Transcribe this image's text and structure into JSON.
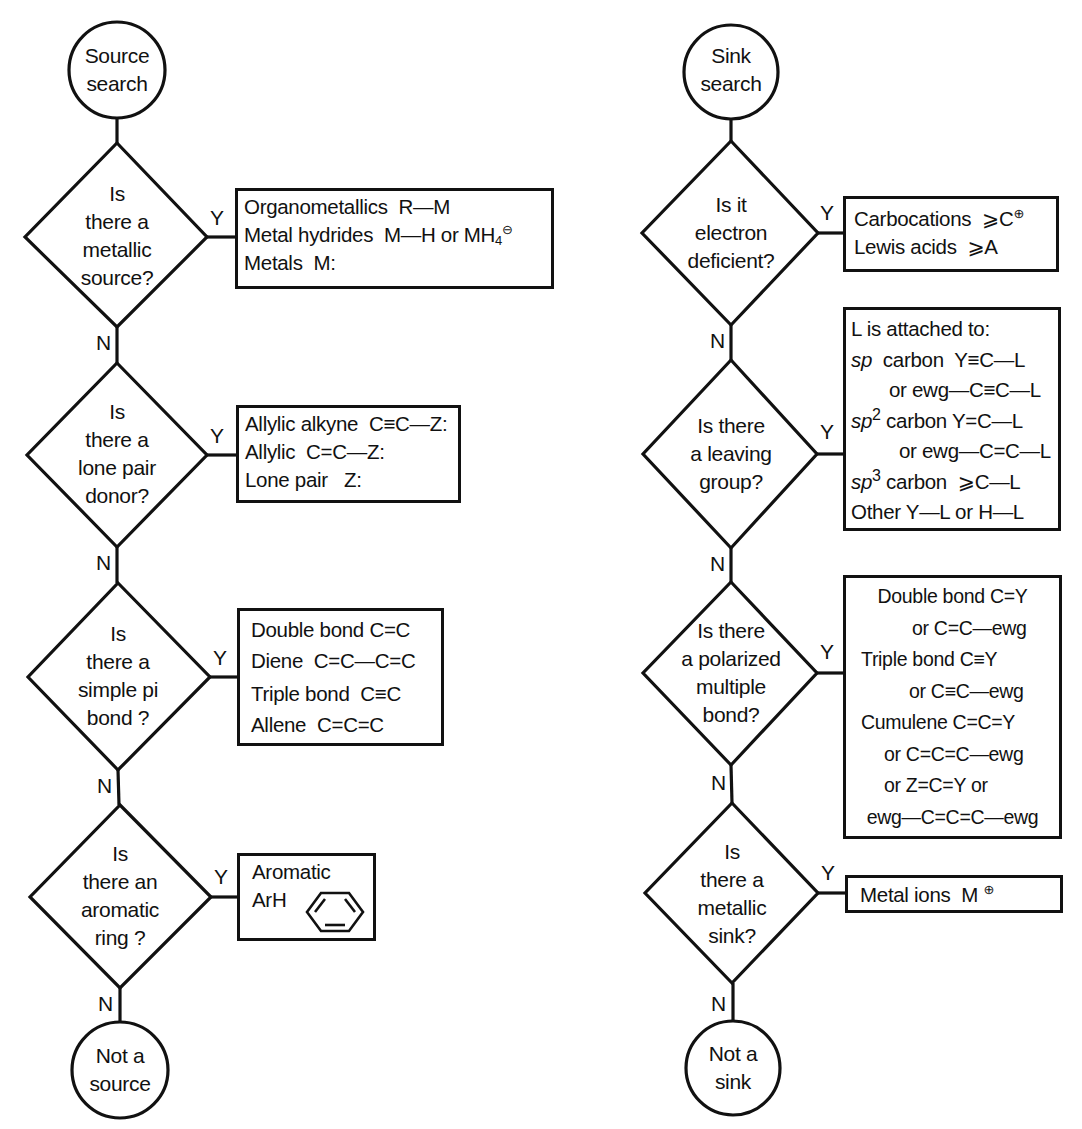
{
  "source_flowchart": {
    "start": {
      "line1": "Source",
      "line2": "search"
    },
    "end": {
      "line1": "Not a",
      "line2": "source"
    },
    "yes_label": "Y",
    "no_label": "N",
    "decisions": [
      {
        "question": [
          "Is",
          "there a",
          "metallic",
          "source?"
        ],
        "answer_rows": [
          {
            "label": "Organometallics",
            "formula": "R—M"
          },
          {
            "label": "Metal hydrides",
            "formula": "M—H or MH",
            "sub": "4",
            "sup": "⊖"
          },
          {
            "label": "Metals",
            "formula": "M:"
          }
        ]
      },
      {
        "question": [
          "Is",
          "there a",
          "lone pair",
          "donor?"
        ],
        "answer_rows": [
          {
            "label": "Allylic alkyne",
            "formula": "C≡C—Z:"
          },
          {
            "label": "Allylic",
            "formula": "C=C—Z:"
          },
          {
            "label": "Lone pair",
            "formula": "Z:"
          }
        ]
      },
      {
        "question": [
          "Is",
          "there a",
          "simple pi",
          "bond ?"
        ],
        "answer_rows": [
          {
            "label": "Double bond",
            "formula": "C=C"
          },
          {
            "label": "Diene",
            "formula": "C=C—C=C"
          },
          {
            "label": "Triple bond",
            "formula": "C≡C"
          },
          {
            "label": "Allene",
            "formula": "C=C=C"
          }
        ]
      },
      {
        "question": [
          "Is",
          "there an",
          "aromatic",
          "ring ?"
        ],
        "answer_rows": [
          {
            "label": "Aromatic",
            "formula": ""
          },
          {
            "label": "ArH",
            "formula": "benzene-ring"
          }
        ]
      }
    ]
  },
  "sink_flowchart": {
    "start": {
      "line1": "Sink",
      "line2": "search"
    },
    "end": {
      "line1": "Not a",
      "line2": "sink"
    },
    "yes_label": "Y",
    "no_label": "N",
    "decisions": [
      {
        "question": [
          "Is it",
          "electron",
          "deficient?"
        ],
        "answer_rows": [
          {
            "label": "Carbocations",
            "formula": "⩾C",
            "sup": "⊕"
          },
          {
            "label": "Lewis acids",
            "formula": "⩾A"
          }
        ]
      },
      {
        "question": [
          "Is there",
          "a leaving",
          "group?"
        ],
        "answer_rows": [
          {
            "text": "L is attached to:"
          },
          {
            "italic": "sp",
            "label": "carbon",
            "formula": "Y≡C—L"
          },
          {
            "text": "or  ewg—C≡C—L"
          },
          {
            "italic": "sp",
            "sup": "2",
            "label": "carbon",
            "formula": "Y=C—L"
          },
          {
            "text": "or ewg—C=C—L"
          },
          {
            "italic": "sp",
            "sup": "3",
            "label": "carbon",
            "formula": "⩾C—L"
          },
          {
            "text": "Other  Y—L or  H—L"
          }
        ]
      },
      {
        "question": [
          "Is there",
          "a polarized",
          "multiple",
          "bond?"
        ],
        "answer_rows": [
          {
            "text": "Double bond C=Y"
          },
          {
            "text": "or C=C—ewg"
          },
          {
            "text": "Triple bond C≡Y"
          },
          {
            "text": "or C≡C—ewg"
          },
          {
            "text": "Cumulene C=C=Y"
          },
          {
            "text": "or  C=C=C—ewg"
          },
          {
            "text": "or  Z=C=Y  or"
          },
          {
            "text": "ewg—C=C=C—ewg"
          }
        ]
      },
      {
        "question": [
          "Is",
          "there a",
          "metallic",
          "sink?"
        ],
        "answer_rows": [
          {
            "label": "Metal ions",
            "formula": "M",
            "sup": "⊕"
          }
        ]
      }
    ]
  },
  "colors": {
    "stroke": "#111111",
    "background": "#ffffff"
  }
}
